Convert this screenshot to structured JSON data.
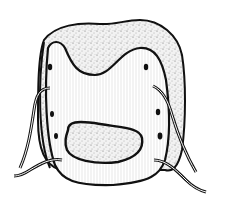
{
  "figure": {
    "type": "line-illustration",
    "colors": {
      "background": "#ffffff",
      "ink": "#111111",
      "stipple_fill": "#e8e8e8",
      "plate_fill": "#ffffff",
      "hatch": "#bdbdbd"
    },
    "elements": {
      "stippled_mass": "stippled-mass",
      "plate": "perforated-plate",
      "oval_window": "stippled-oval-window",
      "holes_left_count": 4,
      "holes_right_count": 4,
      "sutures_count": 4
    }
  }
}
